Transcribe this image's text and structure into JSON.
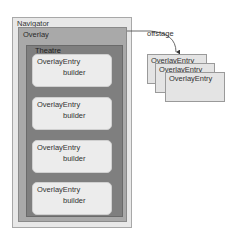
{
  "diagram": {
    "navigator": {
      "label": "Navigator"
    },
    "overlay": {
      "label": "Overlay"
    },
    "theatre": {
      "label": "Theatre",
      "entries": [
        {
          "title": "OverlayEntry",
          "content": "builder"
        },
        {
          "title": "OverlayEntry",
          "content": "builder"
        },
        {
          "title": "OverlayEntry",
          "content": "builder"
        },
        {
          "title": "OverlayEntry",
          "content": "builder"
        }
      ]
    },
    "offstage": {
      "label": "offstage",
      "entries": [
        {
          "title": "OverlayEntry"
        },
        {
          "title": "OverlayEntry"
        },
        {
          "title": "OverlayEntry"
        }
      ]
    }
  }
}
